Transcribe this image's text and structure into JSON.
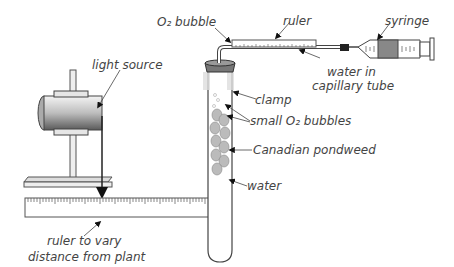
{
  "labels": {
    "o2_bubble": "O₂ bubble",
    "ruler": "ruler",
    "syringe": "syringe",
    "light_source": "light source",
    "water_in_capillary_line1": "water in",
    "water_in_capillary_line2": "capillary tube",
    "clamp": "clamp",
    "small_o2_bubbles": "small O₂ bubbles",
    "canadian_pondweed": "Canadian pondweed",
    "water": "water",
    "ruler_to_vary_line1": "ruler to vary",
    "ruler_to_vary_line2": "distance from plant"
  },
  "colors": {
    "line": "#333333",
    "text": "#444444",
    "gray": "#9a9a9a"
  }
}
